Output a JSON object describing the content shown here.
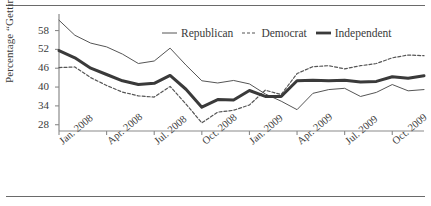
{
  "chart_data": {
    "type": "line",
    "title": "",
    "xlabel": "",
    "ylabel": "Percentage “Getting Better”",
    "ylim": [
      26,
      62
    ],
    "yticks": [
      28,
      34,
      40,
      46,
      52,
      58
    ],
    "grid": false,
    "legend_position": "top-center",
    "x_tick_labels": [
      "Jan. 2008",
      "Apr. 2008",
      "Jul. 2008",
      "Oct. 2008",
      "Jan. 2009",
      "Apr. 2009",
      "Jul. 2009",
      "Oct. 2009"
    ],
    "x_tick_indices": [
      0,
      3,
      6,
      9,
      12,
      15,
      18,
      21
    ],
    "x": [
      "Jan. 2008",
      "Feb. 2008",
      "Mar. 2008",
      "Apr. 2008",
      "May 2008",
      "Jun. 2008",
      "Jul. 2008",
      "Aug. 2008",
      "Sep. 2008",
      "Oct. 2008",
      "Nov. 2008",
      "Dec. 2008",
      "Jan. 2009",
      "Feb. 2009",
      "Mar. 2009",
      "Apr. 2009",
      "May 2009",
      "Jun. 2009",
      "Jul. 2009",
      "Aug. 2009",
      "Sep. 2009",
      "Oct. 2009",
      "Nov. 2009",
      "Dec. 2009"
    ],
    "series": [
      {
        "name": "Republican",
        "style": "solid-thin",
        "color": "#555555",
        "values": [
          61.3,
          56.5,
          54.0,
          52.8,
          50.5,
          47.5,
          48.3,
          52.4,
          47.0,
          42.0,
          41.3,
          42.1,
          41.0,
          37.8,
          35.5,
          32.8,
          38.0,
          39.2,
          39.6,
          37.0,
          38.3,
          40.8,
          38.8,
          39.2
        ]
      },
      {
        "name": "Democrat",
        "style": "dashed",
        "color": "#555555",
        "values": [
          46.2,
          46.4,
          43.0,
          40.5,
          38.4,
          37.2,
          36.8,
          40.2,
          34.6,
          28.6,
          32.0,
          32.6,
          34.3,
          39.0,
          37.6,
          44.3,
          46.5,
          46.8,
          45.8,
          46.8,
          47.5,
          49.3,
          50.2,
          50.0
        ]
      },
      {
        "name": "Independent",
        "style": "solid-thick",
        "color": "#3a3a3a",
        "values": [
          51.6,
          49.3,
          46.0,
          44.0,
          42.0,
          40.8,
          41.2,
          43.7,
          39.3,
          33.6,
          36.0,
          35.9,
          38.9,
          37.0,
          37.0,
          42.0,
          42.2,
          42.0,
          42.2,
          41.6,
          41.8,
          43.3,
          42.8,
          43.6
        ]
      }
    ]
  },
  "legend": {
    "items": [
      {
        "label": "Republican",
        "icon": "solid-thin-line-icon"
      },
      {
        "label": "Democrat",
        "icon": "dashed-line-icon"
      },
      {
        "label": "Independent",
        "icon": "solid-thick-line-icon"
      }
    ]
  },
  "axis": {
    "y_label": "Percentage “Getting Better”"
  }
}
